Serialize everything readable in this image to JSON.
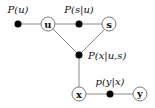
{
  "diagram": {
    "type": "factor-graph",
    "variables": [
      {
        "id": "u",
        "label": "u",
        "x": 48,
        "y": 24
      },
      {
        "id": "s",
        "label": "s",
        "x": 109,
        "y": 24
      },
      {
        "id": "x",
        "label": "x",
        "x": 79,
        "y": 94
      },
      {
        "id": "y",
        "label": "y",
        "x": 140,
        "y": 94
      }
    ],
    "factors": [
      {
        "id": "f_u",
        "label": "P(u)",
        "x": 18,
        "y": 24
      },
      {
        "id": "f_s",
        "label": "P(s|u)",
        "x": 79,
        "y": 24
      },
      {
        "id": "f_x",
        "label": "P(x|u,s)",
        "x": 79,
        "y": 55
      },
      {
        "id": "f_y",
        "label": "p(y|x)",
        "x": 110,
        "y": 94
      }
    ],
    "edges": [
      [
        "f_u",
        "u"
      ],
      [
        "u",
        "f_s"
      ],
      [
        "f_s",
        "s"
      ],
      [
        "u",
        "f_x"
      ],
      [
        "s",
        "f_x"
      ],
      [
        "f_x",
        "x"
      ],
      [
        "x",
        "f_y"
      ],
      [
        "f_y",
        "y"
      ]
    ]
  }
}
